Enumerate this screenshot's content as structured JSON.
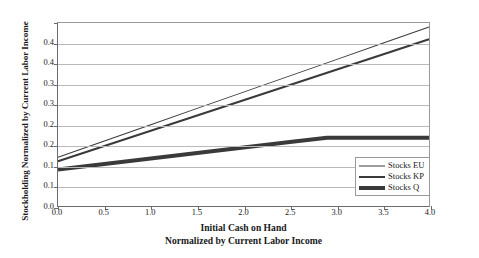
{
  "chart_data": {
    "type": "line",
    "title": "",
    "xlabel": "Initial Cash on Hand Normalized by Current Labor Income",
    "xlabel_lines": [
      "Initial Cash on Hand",
      "Normalized by Current Labor Income"
    ],
    "ylabel": "Stockholding Normalized by Current Labor Income",
    "xlim": [
      0.0,
      4.0
    ],
    "ylim": [
      0.0,
      0.45
    ],
    "xticks": [
      0.0,
      0.5,
      1.0,
      1.5,
      2.0,
      2.5,
      3.0,
      3.5,
      4.0
    ],
    "xticklabels": [
      "0.0",
      "0.5",
      "1.0",
      "1.5",
      "2.0",
      "2.5",
      "3.0",
      "3.5",
      "4.0"
    ],
    "yticks": [
      0.0,
      0.05,
      0.1,
      0.15,
      0.2,
      0.25,
      0.3,
      0.35,
      0.4,
      0.45
    ],
    "yticklabels": [
      "0.0",
      "0.1",
      "0.1",
      "0.2",
      "0.2",
      "0.3",
      "0.3",
      "0.4",
      "0.4"
    ],
    "grid": "horizontal",
    "legend_position": "lower right",
    "series": [
      {
        "name": "Stocks EU",
        "line_width": 1,
        "color": "#3a3a3a",
        "x": [
          0.0,
          0.5,
          1.0,
          1.5,
          2.0,
          2.5,
          3.0,
          3.5,
          4.0
        ],
        "values": [
          0.12,
          0.16,
          0.2,
          0.24,
          0.28,
          0.32,
          0.36,
          0.4,
          0.44
        ]
      },
      {
        "name": "Stocks KP",
        "line_width": 2,
        "color": "#3a3a3a",
        "x": [
          0.0,
          0.5,
          1.0,
          1.5,
          2.0,
          2.5,
          3.0,
          3.5,
          4.0
        ],
        "values": [
          0.11,
          0.1475,
          0.185,
          0.2225,
          0.26,
          0.2975,
          0.335,
          0.3725,
          0.41
        ]
      },
      {
        "name": "Stocks Q",
        "line_width": 4,
        "color": "#3a3a3a",
        "x": [
          0.0,
          0.5,
          1.0,
          1.5,
          2.0,
          2.5,
          2.9,
          3.5,
          4.0
        ],
        "values": [
          0.09,
          0.1035,
          0.117,
          0.1305,
          0.144,
          0.1575,
          0.168,
          0.168,
          0.168
        ]
      }
    ]
  },
  "legend": {
    "items": [
      {
        "label": "Stocks EU"
      },
      {
        "label": "Stocks KP"
      },
      {
        "label": "Stocks Q"
      }
    ]
  }
}
